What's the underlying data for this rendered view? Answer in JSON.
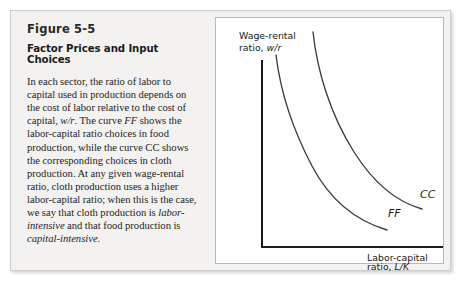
{
  "figure": {
    "number": "Figure 5-5",
    "heading": "Factor Prices and Input Choices",
    "body_html": "In each sector, the ratio of labor to capital used in production depends on the cost of labor relative to the cost of capital, <i>w/r</i>. The curve <i>FF</i> shows the labor-capital ratio choices in food production, while the curve CC shows the corresponding choices in cloth production. At any given wage-rental ratio, cloth production uses a higher labor-capital ratio; when this is the case, we say that cloth production is <i>labor-intensive</i> and that food production is <i>capital-intensive</i>.",
    "body_text": "In each sector, the ratio of labor to capital used in production depends on the cost of labor relative to the cost of capital, w/r. The curve FF shows the labor-capital ratio choices in food production, while the curve CC shows the corresponding choices in cloth production. At any given wage-rental ratio, cloth production uses a higher labor-capital ratio; when this is the case, we say that cloth production is labor-intensive and that food production is capital-intensive."
  },
  "chart_data": {
    "type": "line",
    "title": "",
    "ylabel_line1": "Wage-rental",
    "ylabel_line2_prefix": "ratio, ",
    "ylabel_line2_italic": "w/r",
    "xlabel_line1": "Labor-capital",
    "xlabel_line2_prefix": "ratio, ",
    "xlabel_line2_italic": "L/K",
    "grid": false,
    "axis_ticks": false,
    "xlim": [
      0,
      1
    ],
    "ylim": [
      0,
      1
    ],
    "series": [
      {
        "name": "FF",
        "label": "FF",
        "description": "downward-sloping convex isoquant-style curve for food production (lower / left of CC)",
        "x": [
          0.075,
          0.12,
          0.18,
          0.26,
          0.36,
          0.48,
          0.6,
          0.68
        ],
        "y": [
          0.84,
          0.68,
          0.52,
          0.38,
          0.27,
          0.19,
          0.14,
          0.12
        ],
        "label_position": {
          "x": 0.7,
          "y": 0.19
        }
      },
      {
        "name": "CC",
        "label": "CC",
        "description": "downward-sloping convex isoquant-style curve for cloth production (upper / right of FF)",
        "x": [
          0.275,
          0.33,
          0.4,
          0.48,
          0.58,
          0.7,
          0.82,
          0.875
        ],
        "y": [
          0.96,
          0.8,
          0.62,
          0.47,
          0.34,
          0.25,
          0.2,
          0.185
        ],
        "label_position": {
          "x": 0.885,
          "y": 0.255
        }
      }
    ]
  },
  "colors": {
    "frame_background": "#f3f2f0",
    "frame_border": "#cfcdc9",
    "chart_background": "#ffffff",
    "chart_border": "#b9b7b3",
    "axis": "#1a1a1a",
    "curve": "#3a3a3a",
    "text": "#232323"
  }
}
